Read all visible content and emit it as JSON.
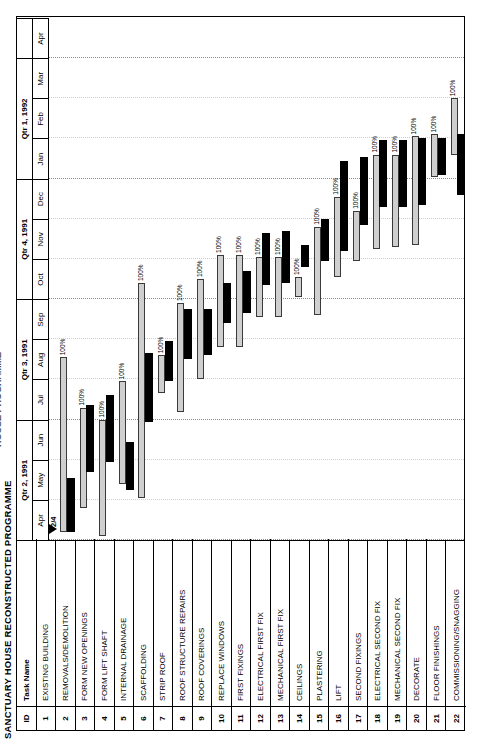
{
  "document": {
    "title": "SANCTUARY HOUSE RECONSTRUCTED PROGRAMME",
    "title_partial_top": "HOUSE PROGRAMME"
  },
  "table": {
    "headers": {
      "id": "ID",
      "name": "Task Name"
    }
  },
  "timescale": {
    "quarters": [
      {
        "label": "Qtr 2, 1991",
        "start_month": 0,
        "span": 3
      },
      {
        "label": "Qtr 3, 1991",
        "start_month": 3,
        "span": 3
      },
      {
        "label": "Qtr 4, 1991",
        "start_month": 6,
        "span": 3
      },
      {
        "label": "Qtr 1, 1992",
        "start_month": 9,
        "span": 3
      },
      {
        "label": "",
        "start_month": 12,
        "span": 1
      }
    ],
    "months": [
      "Apr",
      "May",
      "Jun",
      "Jul",
      "Aug",
      "Sep",
      "Oct",
      "Nov",
      "Dec",
      "Jan",
      "Feb",
      "Mar",
      "Apr"
    ]
  },
  "marker": {
    "label": "2/4",
    "month_offset": 0.15
  },
  "legend": {
    "plan_color": "#cfcfcf",
    "actual_color": "#000000",
    "pct_complete": "100%"
  },
  "chart_data": {
    "type": "bar",
    "title": "SANCTUARY HOUSE RECONSTRUCTED PROGRAMME",
    "xlabel": "",
    "ylabel": "",
    "grid": true,
    "categories": [
      "EXISTING BUILDING",
      "REMOVALS/DEMOLITION",
      "FORM NEW OPENINGS",
      "FORM LIFT SHAFT",
      "INTERNAL DRAINAGE",
      "SCAFFOLDING",
      "STRIP ROOF",
      "ROOF STRUCTURE REPAIRS",
      "ROOF COVERINGS",
      "REPLACE WINDOWS",
      "FIRST FIXINGS",
      "ELECTRICAL FIRST FIX",
      "MECHANICAL FIRST FIX",
      "CEILINGS",
      "PLASTERING",
      "LIFT",
      "SECOND FIXINGS",
      "ELECTRICAL SECOND FIX",
      "MECHANICAL SECOND FIX",
      "DECORATE",
      "FLOOR FINISHINGS",
      "COMMISSIONING/SNAGGING"
    ],
    "x_axis_months": [
      "Apr 1991",
      "May 1991",
      "Jun 1991",
      "Jul 1991",
      "Aug 1991",
      "Sep 1991",
      "Oct 1991",
      "Nov 1991",
      "Dec 1991",
      "Jan 1992",
      "Feb 1992",
      "Mar 1992",
      "Apr 1992"
    ],
    "tasks": [
      {
        "id": "1",
        "name": "EXISTING BUILDING",
        "plan_start": null,
        "plan_end": null,
        "act_start": null,
        "act_end": null,
        "pct": ""
      },
      {
        "id": "2",
        "name": "REMOVALS/DEMOLITION",
        "plan_start": 0.2,
        "plan_end": 4.55,
        "act_start": 0.2,
        "act_end": 1.55,
        "pct": "100%"
      },
      {
        "id": "3",
        "name": "FORM NEW OPENINGS",
        "plan_start": 0.8,
        "plan_end": 3.3,
        "act_start": 1.7,
        "act_end": 3.35,
        "pct": "100%"
      },
      {
        "id": "4",
        "name": "FORM LIFT SHAFT",
        "plan_start": 0.1,
        "plan_end": 3.0,
        "act_start": 1.95,
        "act_end": 3.6,
        "pct": "100%"
      },
      {
        "id": "5",
        "name": "INTERNAL DRAINAGE",
        "plan_start": 1.4,
        "plan_end": 3.95,
        "act_start": 1.25,
        "act_end": 2.45,
        "pct": "100%"
      },
      {
        "id": "6",
        "name": "SCAFFOLDING",
        "plan_start": 1.05,
        "plan_end": 6.4,
        "act_start": 2.95,
        "act_end": 4.65,
        "pct": "100%"
      },
      {
        "id": "7",
        "name": "STRIP ROOF",
        "plan_start": 3.65,
        "plan_end": 4.6,
        "act_start": 3.95,
        "act_end": 4.95,
        "pct": "100%"
      },
      {
        "id": "8",
        "name": "ROOF STRUCTURE REPAIRS",
        "plan_start": 3.2,
        "plan_end": 5.9,
        "act_start": 4.5,
        "act_end": 5.75,
        "pct": "100%"
      },
      {
        "id": "9",
        "name": "ROOF COVERINGS",
        "plan_start": 4.0,
        "plan_end": 6.5,
        "act_start": 4.6,
        "act_end": 5.75,
        "pct": "100%"
      },
      {
        "id": "10",
        "name": "REPLACE WINDOWS",
        "plan_start": 4.8,
        "plan_end": 7.1,
        "act_start": 5.4,
        "act_end": 6.4,
        "pct": "100%"
      },
      {
        "id": "11",
        "name": "FIRST FIXINGS",
        "plan_start": 4.8,
        "plan_end": 7.1,
        "act_start": 5.65,
        "act_end": 6.7,
        "pct": "100%"
      },
      {
        "id": "12",
        "name": "ELECTRICAL FIRST FIX",
        "plan_start": 5.55,
        "plan_end": 7.05,
        "act_start": 6.35,
        "act_end": 7.65,
        "pct": "100%"
      },
      {
        "id": "13",
        "name": "MECHANICAL FIRST FIX",
        "plan_start": 5.55,
        "plan_end": 7.05,
        "act_start": 6.4,
        "act_end": 7.7,
        "pct": "100%"
      },
      {
        "id": "14",
        "name": "CEILINGS",
        "plan_start": 6.05,
        "plan_end": 6.55,
        "act_start": 6.8,
        "act_end": 7.35,
        "pct": "100%"
      },
      {
        "id": "15",
        "name": "PLASTERING",
        "plan_start": 5.6,
        "plan_end": 7.8,
        "act_start": 6.95,
        "act_end": 8.0,
        "pct": "100%"
      },
      {
        "id": "16",
        "name": "LIFT",
        "plan_start": 6.55,
        "plan_end": 8.55,
        "act_start": 7.2,
        "act_end": 9.45,
        "pct": "100%"
      },
      {
        "id": "17",
        "name": "SECOND FIXINGS",
        "plan_start": 6.95,
        "plan_end": 8.2,
        "act_start": 7.85,
        "act_end": 9.55,
        "pct": "100%"
      },
      {
        "id": "18",
        "name": "ELECTRICAL SECOND FIX",
        "plan_start": 7.25,
        "plan_end": 9.6,
        "act_start": 8.3,
        "act_end": 9.95,
        "pct": "100%"
      },
      {
        "id": "19",
        "name": "MECHANICAL SECOND FIX",
        "plan_start": 7.3,
        "plan_end": 9.6,
        "act_start": 8.3,
        "act_end": 9.95,
        "pct": "100%"
      },
      {
        "id": "20",
        "name": "DECORATE",
        "plan_start": 7.35,
        "plan_end": 10.05,
        "act_start": 8.35,
        "act_end": 10.0,
        "pct": "100%"
      },
      {
        "id": "21",
        "name": "FLOOR FINISHINGS",
        "plan_start": 9.05,
        "plan_end": 10.1,
        "act_start": 9.1,
        "act_end": 10.0,
        "pct": "100%"
      },
      {
        "id": "22",
        "name": "COMMISSIONING/SNAGGING",
        "plan_start": 9.6,
        "plan_end": 11.0,
        "act_start": 8.6,
        "act_end": 10.1,
        "pct": "100%"
      }
    ]
  }
}
